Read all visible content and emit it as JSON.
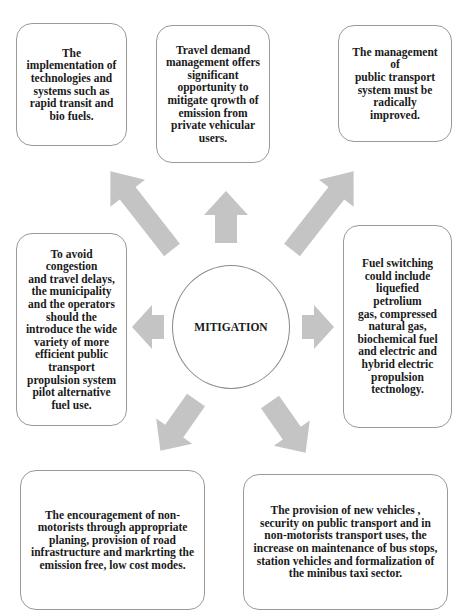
{
  "diagram": {
    "center": {
      "label": "MITIGATION"
    },
    "boxes": [
      {
        "id": "top-left",
        "text": "The\nimplementation of\ntechnologies and\nsystems such as\nrapid transit and\nbio fuels."
      },
      {
        "id": "top-center",
        "text": "Travel demand\nmanagement offers\nsignificant\nopportunity to\nmitigate qrowth of\nemission from\nprivate vehicular\nusers."
      },
      {
        "id": "top-right",
        "text": "The management of\npublic transport\nsystem must be\nradically improved."
      },
      {
        "id": "middle-left",
        "text": "To avoid congestion\nand travel delays,\nthe  municipality\nand the operators\nshould the\nintroduce the wide\nvariety of more\nefficient public\ntransport\npropulsion system\npilot alternative\nfuel use."
      },
      {
        "id": "middle-right",
        "text": "Fuel switching\ncould include\nliquefied petrolium\ngas, compressed\nnatural gas,\nbiochemical fuel\nand electric and\nhybrid electric\npropulsion\ntectnology."
      },
      {
        "id": "bottom-left",
        "text": "The encouragement of non-\nmotorists through appropriate\nplaning, provision of road\ninfrastructure  and markrting the\nemission free, low cost modes."
      },
      {
        "id": "bottom-right",
        "text": "The provision of new vehicles ,\nsecurity on public transport and in\nnon-motorists transport uses, the\nincrease on maintenance of bus stops,\nstation vehicles and formalization of\nthe minibus taxi sector."
      }
    ],
    "colors": {
      "arrow_fill": "#c4c4c4",
      "box_border": "#9a9a9a",
      "text": "#1a1a1a"
    }
  }
}
